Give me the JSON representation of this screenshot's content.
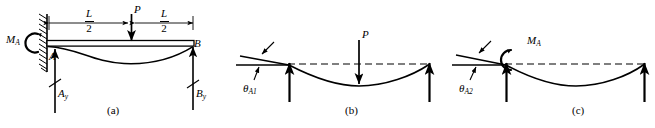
{
  "figure": {
    "type": "structural-beam-superposition-diagram",
    "stroke_color": "#000000",
    "background_color": "#ffffff"
  },
  "panels": [
    {
      "id": "a",
      "caption": "(a)",
      "kind": "propped-cantilever",
      "labels": {
        "wall_moment": "M",
        "wall_moment_sub": "A",
        "point_a": "A",
        "point_b": "B",
        "reaction_a": "A",
        "reaction_a_sub": "y",
        "reaction_b": "B",
        "reaction_b_sub": "y",
        "load": "P",
        "dim_left_num": "L",
        "dim_left_den": "2",
        "dim_right_num": "L",
        "dim_right_den": "2"
      }
    },
    {
      "id": "b",
      "caption": "(b)",
      "kind": "simply-supported-with-point-load",
      "labels": {
        "load": "P",
        "slope": "θ",
        "slope_sub": "A1"
      }
    },
    {
      "id": "c",
      "caption": "(c)",
      "kind": "simply-supported-with-end-moment",
      "labels": {
        "moment": "M",
        "moment_sub": "A",
        "slope": "θ",
        "slope_sub": "A2"
      }
    }
  ]
}
